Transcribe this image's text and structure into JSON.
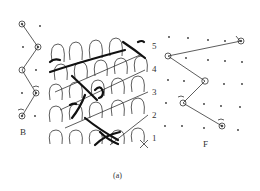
{
  "figure": {
    "caption": "(a)",
    "back_bar_label": "B",
    "front_bar_label": "F",
    "course_numbers": [
      "1",
      "2",
      "3",
      "4",
      "5"
    ],
    "stroke_color": "#333333",
    "background": "#ffffff"
  },
  "back_bar_notation": {
    "label": "B",
    "points": [
      [
        22,
        24
      ],
      [
        38,
        47
      ],
      [
        22,
        70
      ],
      [
        36,
        93
      ],
      [
        22,
        116
      ]
    ]
  },
  "front_bar_notation": {
    "label": "F",
    "points": [
      [
        241,
        41
      ],
      [
        168,
        56
      ],
      [
        205,
        81
      ],
      [
        183,
        103
      ],
      [
        222,
        126
      ]
    ]
  },
  "fabric_view": {
    "description": "knitted loop structure with highlighted inlay yarn",
    "courses": 5
  }
}
